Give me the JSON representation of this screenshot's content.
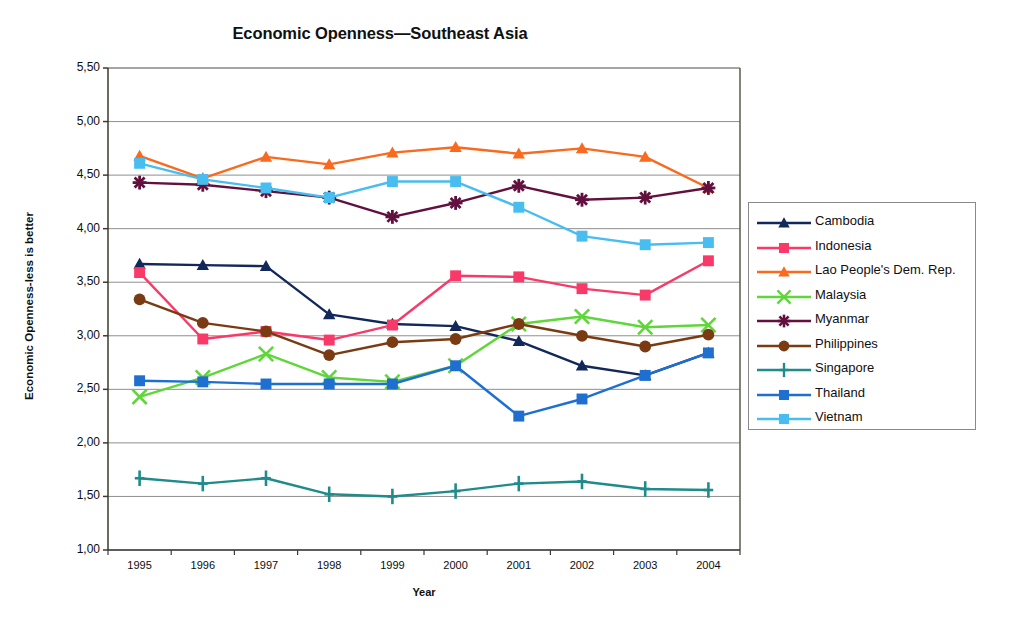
{
  "chart_data": {
    "type": "line",
    "title": "Economic Openness—Southeast Asia",
    "xlabel": "Year",
    "ylabel": "Economic Openness-less is better",
    "x": [
      1995,
      1996,
      1997,
      1998,
      1999,
      2000,
      2001,
      2002,
      2003,
      2004
    ],
    "categories": [
      "1995",
      "1996",
      "1997",
      "1998",
      "1999",
      "2000",
      "2001",
      "2002",
      "2003",
      "2004"
    ],
    "ylim": [
      1.0,
      5.5
    ],
    "yticks": [
      1.0,
      1.5,
      2.0,
      2.5,
      3.0,
      3.5,
      4.0,
      4.5,
      5.0,
      5.5
    ],
    "ytick_labels": [
      "1,00",
      "1,50",
      "2,00",
      "2,50",
      "3,00",
      "3,50",
      "4,00",
      "4,50",
      "5,00",
      "5,50"
    ],
    "grid": "horizontal",
    "legend_position": "right",
    "decimal_separator": ",",
    "series": [
      {
        "name": "Cambodia",
        "color": "#12285a",
        "marker": "triangle",
        "values": [
          3.67,
          3.66,
          3.65,
          3.2,
          3.11,
          3.09,
          2.95,
          2.72,
          2.63,
          2.84
        ]
      },
      {
        "name": "Indonesia",
        "color": "#f93a69",
        "marker": "square",
        "values": [
          3.59,
          2.97,
          3.04,
          2.96,
          3.1,
          3.56,
          3.55,
          3.44,
          3.38,
          3.7
        ]
      },
      {
        "name": "Lao People's Dem. Rep.",
        "color": "#f96a1e",
        "marker": "triangle",
        "values": [
          4.68,
          4.47,
          4.67,
          4.6,
          4.71,
          4.76,
          4.7,
          4.75,
          4.67,
          4.38
        ]
      },
      {
        "name": "Malaysia",
        "color": "#5fd63a",
        "marker": "cross",
        "values": [
          2.43,
          2.61,
          2.83,
          2.61,
          2.57,
          2.72,
          3.11,
          3.18,
          3.08,
          3.1
        ]
      },
      {
        "name": "Myanmar",
        "color": "#62113f",
        "marker": "star",
        "values": [
          4.43,
          4.41,
          4.35,
          4.29,
          4.11,
          4.24,
          4.4,
          4.27,
          4.29,
          4.38
        ]
      },
      {
        "name": "Philippines",
        "color": "#7a3b12",
        "marker": "circle",
        "values": [
          3.34,
          3.12,
          3.04,
          2.82,
          2.94,
          2.97,
          3.11,
          3.0,
          2.9,
          3.01
        ]
      },
      {
        "name": "Singapore",
        "color": "#1f8b8b",
        "marker": "plus",
        "values": [
          1.67,
          1.62,
          1.67,
          1.52,
          1.5,
          1.55,
          1.62,
          1.64,
          1.57,
          1.56
        ]
      },
      {
        "name": "Thailand",
        "color": "#1f6fd0",
        "marker": "square",
        "values": [
          2.58,
          2.57,
          2.55,
          2.55,
          2.55,
          2.72,
          2.25,
          2.41,
          2.63,
          2.84
        ]
      },
      {
        "name": "Vietnam",
        "color": "#48bdf0",
        "marker": "square",
        "values": [
          4.61,
          4.46,
          4.38,
          4.29,
          4.44,
          4.44,
          4.2,
          3.93,
          3.85,
          3.87
        ]
      }
    ]
  }
}
